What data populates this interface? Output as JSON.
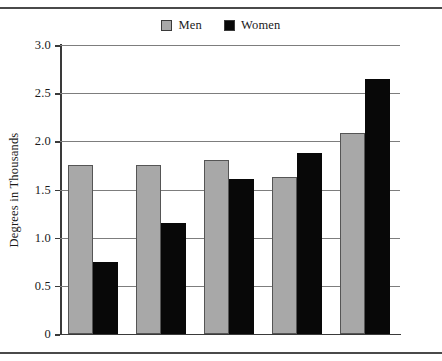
{
  "legend": {
    "position": "top-center",
    "entries": [
      {
        "label": "Men",
        "color": "#a8a8a8",
        "swatch": "gray-square-icon"
      },
      {
        "label": "Women",
        "color": "#080808",
        "swatch": "black-square-icon"
      }
    ]
  },
  "axes": {
    "ylabel": "Degrees in Thousands",
    "yticks": [
      "0",
      "0.5",
      "1.0",
      "1.5",
      "2.0",
      "2.5",
      "3.0"
    ],
    "ytick_values": [
      0,
      0.5,
      1.0,
      1.5,
      2.0,
      2.5,
      3.0
    ],
    "xlabel": ""
  },
  "chart_data": {
    "type": "bar",
    "title": "",
    "subtitle": "",
    "xlabel": "",
    "ylabel": "Degrees in Thousands",
    "ylim": [
      0,
      3.0
    ],
    "ytick_step": 0.5,
    "grid": true,
    "legend_position": "top-center",
    "categories": [
      "1976–77",
      "1980–81",
      "1986–87",
      "1990–91",
      "1994–95"
    ],
    "series": [
      {
        "name": "Men",
        "color": "#a8a8a8",
        "values": [
          1.75,
          1.75,
          1.81,
          1.63,
          2.09
        ]
      },
      {
        "name": "Women",
        "color": "#080808",
        "values": [
          0.75,
          1.15,
          1.61,
          1.88,
          2.65
        ]
      }
    ]
  }
}
